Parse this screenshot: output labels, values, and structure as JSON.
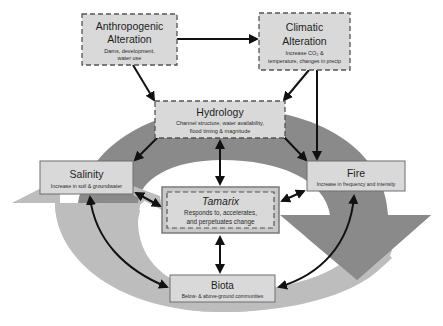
{
  "diagram": {
    "colors": {
      "background": "#ffffff",
      "dark_arc": "#8a8a8a",
      "light_arc": "#bdbdbd",
      "box_fill": "#d9d9d9",
      "box_border": "#6e6e6e",
      "tamarix_outer": "#c8c8c8",
      "arrow": "#111111"
    },
    "nodes": {
      "anthropogenic": {
        "title_line1": "Anthropogenic",
        "title_line2": "Alteration",
        "sub_line1": "Dams, development,",
        "sub_line2": "water use"
      },
      "climatic": {
        "title_line1": "Climatic",
        "title_line2": "Alteration",
        "sub_line1": "Increase CO₂ &",
        "sub_line2": "temperature, changes in precip"
      },
      "hydrology": {
        "title": "Hydrology",
        "sub_line1": "Channel structure, water availability,",
        "sub_line2": "flood timing & magnitude"
      },
      "salinity": {
        "title": "Salinity",
        "sub": "Increase in soil & groundwater"
      },
      "fire": {
        "title": "Fire",
        "sub": "Increase in frequency and intensity"
      },
      "tamarix": {
        "title": "Tamarix",
        "sub_line1": "Responds to, accelerates,",
        "sub_line2": "and perpetuates change"
      },
      "biota": {
        "title": "Biota",
        "sub": "Below- & above-ground communities"
      }
    },
    "edges": [
      {
        "from": "anthropogenic",
        "to": "climatic",
        "type": "one-way"
      },
      {
        "from": "anthropogenic",
        "to": "hydrology",
        "type": "one-way"
      },
      {
        "from": "climatic",
        "to": "hydrology",
        "type": "one-way"
      },
      {
        "from": "climatic",
        "to": "fire",
        "type": "one-way"
      },
      {
        "from": "hydrology",
        "to": "salinity",
        "type": "one-way"
      },
      {
        "from": "hydrology",
        "to": "fire",
        "type": "one-way"
      },
      {
        "from": "hydrology",
        "to": "tamarix",
        "type": "two-way"
      },
      {
        "from": "salinity",
        "to": "tamarix",
        "type": "two-way"
      },
      {
        "from": "fire",
        "to": "tamarix",
        "type": "two-way"
      },
      {
        "from": "tamarix",
        "to": "biota",
        "type": "two-way"
      },
      {
        "from": "salinity",
        "to": "biota",
        "type": "two-way"
      },
      {
        "from": "fire",
        "to": "biota",
        "type": "two-way"
      }
    ]
  }
}
